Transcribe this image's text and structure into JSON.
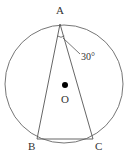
{
  "diagram": {
    "type": "geometry",
    "circle": {
      "center_label": "O",
      "cx": 64,
      "cy": 84,
      "r": 59
    },
    "points": {
      "A": {
        "label": "A",
        "x": 60,
        "y": 24
      },
      "B": {
        "label": "B",
        "x": 37,
        "y": 139
      },
      "C": {
        "label": "C",
        "x": 93,
        "y": 139
      },
      "O": {
        "label": "O",
        "x": 65,
        "y": 85
      }
    },
    "angle": {
      "vertex": "A",
      "label": "30°",
      "value": 30
    },
    "colors": {
      "stroke": "#555555",
      "point": "#000000",
      "text": "#333333"
    }
  }
}
